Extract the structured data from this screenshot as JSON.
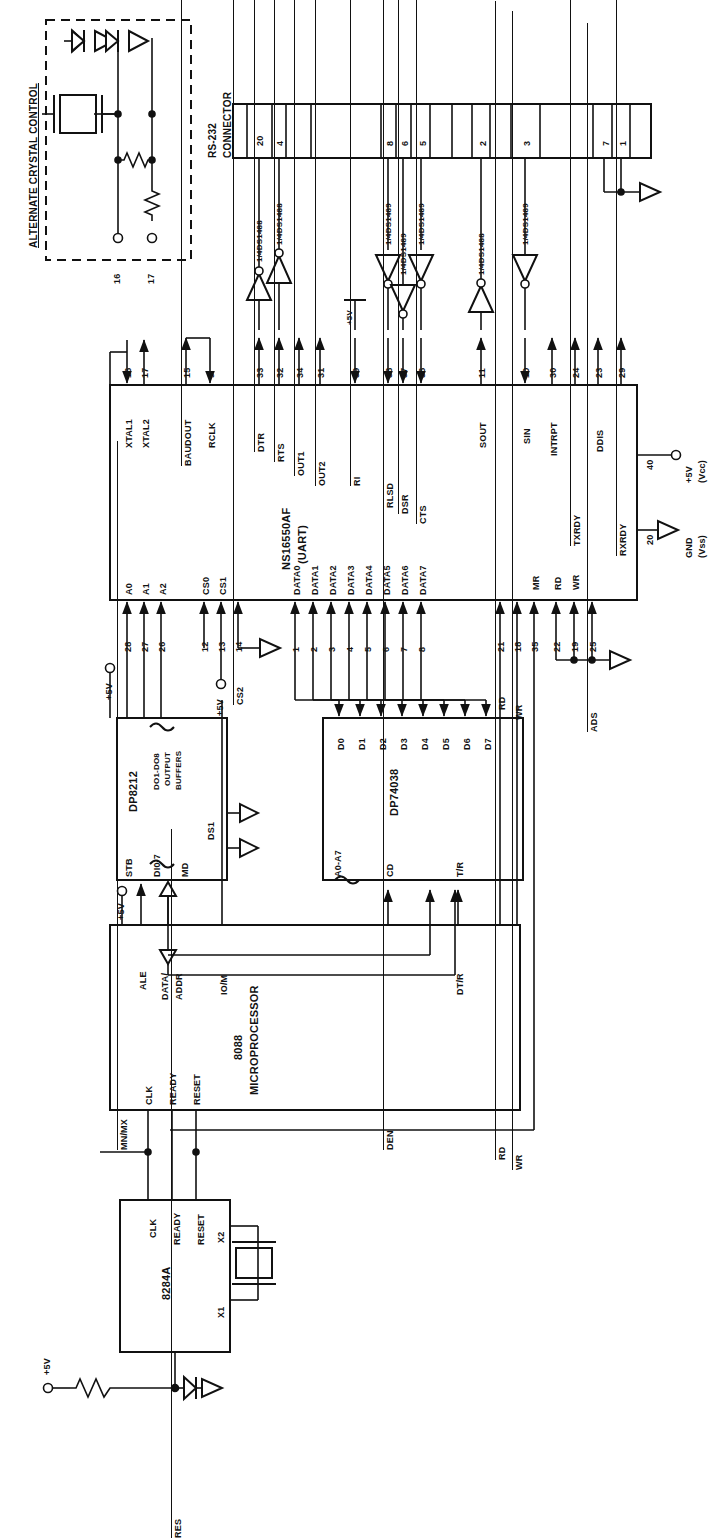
{
  "diagram": {
    "orientation": "text rotated 90 degrees counter-clockwise",
    "line_color": "#111111",
    "background": "#ffffff"
  },
  "alternate_crystal_control": {
    "label": "ALTERNATE CRYSTAL CONTROL",
    "pins": [
      "16",
      "17"
    ],
    "components": [
      "crystal",
      "resistor",
      "resistor",
      "diode",
      "diode"
    ]
  },
  "rs232_connector": {
    "label": "RS-232\nCONNECTOR",
    "label_line1": "RS-232",
    "label_line2": "CONNECTOR",
    "pins": [
      "20",
      "4",
      "",
      "8",
      "6",
      "5",
      "",
      "2",
      "",
      "3",
      "",
      "7",
      "1"
    ]
  },
  "line_drivers": [
    {
      "part": "1/4DS1488",
      "type": "driver"
    },
    {
      "part": "1/4DS1488",
      "type": "driver"
    },
    {
      "part": "1/4DS1489",
      "type": "receiver"
    },
    {
      "part": "1/4DS1489",
      "type": "receiver"
    },
    {
      "part": "1/4DS1489",
      "type": "receiver"
    },
    {
      "part": "1/4DS1488",
      "type": "driver"
    },
    {
      "part": "1/4DS1489",
      "type": "receiver"
    }
  ],
  "uart": {
    "name": "NS16550AF",
    "sub": "(UART)",
    "top_pins": [
      {
        "num": "16",
        "label": "XTAL1",
        "dir": "in"
      },
      {
        "num": "17",
        "label": "XTAL2",
        "dir": "out"
      },
      {
        "num": "15",
        "label": "BAUDOUT",
        "overbar": true,
        "dir": "out"
      },
      {
        "num": "9",
        "label": "RCLK",
        "dir": "in"
      },
      {
        "num": "33",
        "label": "DTR",
        "overbar": true,
        "dir": "out"
      },
      {
        "num": "32",
        "label": "RTS",
        "overbar": true,
        "dir": "out"
      },
      {
        "num": "34",
        "label": "OUT1",
        "overbar": true,
        "dir": "out"
      },
      {
        "num": "31",
        "label": "OUT2",
        "overbar": true,
        "dir": "out"
      },
      {
        "num": "39",
        "label": "RI",
        "overbar": true,
        "dir": "in"
      },
      {
        "num": "38",
        "label": "RLSD",
        "overbar": true,
        "dir": "in"
      },
      {
        "num": "37",
        "label": "DSR",
        "overbar": true,
        "dir": "in"
      },
      {
        "num": "36",
        "label": "CTS",
        "overbar": true,
        "dir": "in"
      },
      {
        "num": "11",
        "label": "SOUT",
        "dir": "out"
      },
      {
        "num": "10",
        "label": "SIN",
        "dir": "in"
      },
      {
        "num": "30",
        "label": "INTRPT",
        "dir": "out"
      },
      {
        "num": "24",
        "label": "TXRDY",
        "overbar": true,
        "dir": "out"
      },
      {
        "num": "23",
        "label": "DDIS",
        "dir": "out"
      },
      {
        "num": "29",
        "label": "RXRDY",
        "overbar": true,
        "dir": "out"
      }
    ],
    "bottom_pins": [
      {
        "num": "28",
        "label": "A0"
      },
      {
        "num": "27",
        "label": "A1"
      },
      {
        "num": "26",
        "label": "A2"
      },
      {
        "num": "12",
        "label": "CS0"
      },
      {
        "num": "13",
        "label": "CS1"
      },
      {
        "num": "14",
        "label": "CS2",
        "overbar": true
      },
      {
        "num": "1",
        "label": "DATA0"
      },
      {
        "num": "2",
        "label": "DATA1"
      },
      {
        "num": "3",
        "label": "DATA2"
      },
      {
        "num": "4",
        "label": "DATA3"
      },
      {
        "num": "5",
        "label": "DATA4"
      },
      {
        "num": "6",
        "label": "DATA5"
      },
      {
        "num": "7",
        "label": "DATA6"
      },
      {
        "num": "8",
        "label": "DATA7"
      },
      {
        "num": "21",
        "label": "RD",
        "overbar": true
      },
      {
        "num": "18",
        "label": "WR",
        "overbar": true
      },
      {
        "num": "35",
        "label": "MR"
      },
      {
        "num": "22",
        "label": "RD"
      },
      {
        "num": "19",
        "label": "WR"
      },
      {
        "num": "25",
        "label": "ADS",
        "overbar": true
      }
    ],
    "power": [
      {
        "num": "40",
        "label": "+5V",
        "sub": "(Vcc)"
      },
      {
        "num": "20",
        "label": "GND",
        "sub": "(Vss)"
      }
    ]
  },
  "dp8212": {
    "name": "DP8212",
    "block_label_1": "DO1-DO8",
    "block_label_2": "OUTPUT",
    "block_label_3": "BUFFERS",
    "pins": [
      "STB",
      "DI0-7",
      "MD",
      "DS1"
    ],
    "supply": "+5V"
  },
  "dp74038": {
    "name": "DP74038",
    "data_pins": [
      "D0",
      "D1",
      "D2",
      "D3",
      "D4",
      "D5",
      "D6",
      "D7"
    ],
    "address_pins": "A0-A7",
    "control_pins": [
      "CD",
      "T/R"
    ],
    "supply": "+5V"
  },
  "cpu_8088": {
    "name_line1": "8088",
    "name_line2": "MICROPROCESSOR",
    "left_pins": [
      "MN/MX",
      "ALE",
      "DATA/",
      "ADDR",
      "IO/M"
    ],
    "mnmx_overbar": "MX",
    "iom_label": "IO/M",
    "mid_pins": [
      "DEN",
      "DT/R"
    ],
    "den_overbar": true,
    "right_pins": [
      "RD",
      "WR"
    ],
    "bottom_pins": [
      "CLK",
      "READY",
      "RESET"
    ],
    "supply": "+5V"
  },
  "clock_8284a": {
    "name": "8284A",
    "outputs": [
      "CLK",
      "READY",
      "RESET"
    ],
    "crystal_pins": [
      "X2",
      "X1"
    ],
    "reset_pin": "RES",
    "reset_overbar": true,
    "supply": "+5V"
  },
  "supplies": [
    {
      "label": "+5V",
      "location": "uart-pin-40"
    },
    {
      "label": "+5V",
      "location": "dp8212"
    },
    {
      "label": "+5V",
      "location": "cs1-pullup"
    },
    {
      "label": "+5V",
      "location": "ri-pullup"
    },
    {
      "label": "+5V",
      "location": "cpu-mnmx"
    },
    {
      "label": "+5V",
      "location": "8284a-res"
    }
  ]
}
